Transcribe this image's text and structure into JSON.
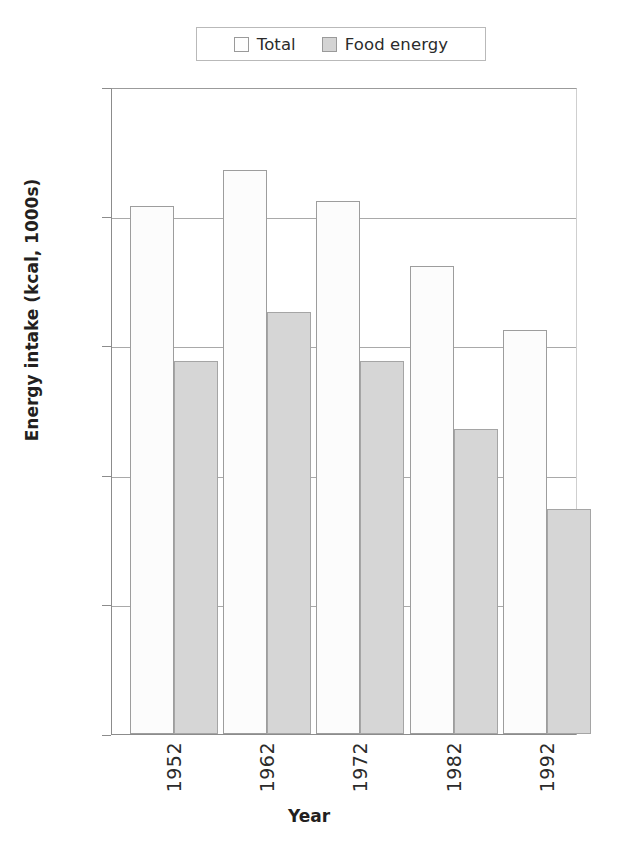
{
  "chart_data": {
    "type": "bar",
    "title": "",
    "xlabel": "Year",
    "ylabel": "Energy intake (kcal, 1000s)",
    "categories": [
      "1952",
      "1962",
      "1972",
      "1982",
      "1992"
    ],
    "series": [
      {
        "name": "Total",
        "values": [
          3.04,
          3.18,
          3.06,
          2.81,
          2.56
        ],
        "color": "#fcfcfc"
      },
      {
        "name": "Food energy",
        "values": [
          2.44,
          2.63,
          2.44,
          2.18,
          1.87
        ],
        "color": "#d6d6d6"
      }
    ],
    "ylim": [
      1,
      3.5
    ],
    "yticks": [
      "1",
      "1.5",
      "2",
      "2.5",
      "3",
      "3.5"
    ],
    "ytick_values": [
      1,
      1.5,
      2,
      2.5,
      3,
      3.5
    ],
    "grid": true,
    "legend_position": "top-center",
    "xtick_rotation": 90
  },
  "legend": {
    "entries": [
      {
        "label": "Total",
        "swatch": "open-square-swatch"
      },
      {
        "label": "Food energy",
        "swatch": "filled-square-swatch"
      }
    ]
  },
  "axes": {
    "y_title": "Energy intake (kcal, 1000s)",
    "x_title": "Year"
  },
  "caption": {
    "partial_text": ""
  }
}
